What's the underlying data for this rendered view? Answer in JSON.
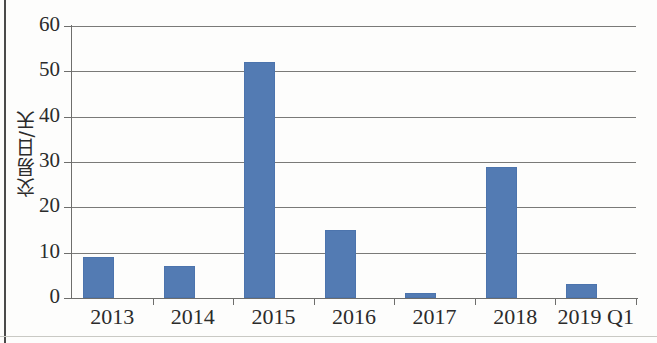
{
  "chart_data": {
    "type": "bar",
    "title": "",
    "subtitle": "",
    "xlabel": "",
    "ylabel": "交易日/天",
    "categories": [
      "2013",
      "2014",
      "2015",
      "2016",
      "2017",
      "2018",
      "2019 Q1"
    ],
    "values": [
      9,
      7,
      52,
      15,
      1,
      29,
      3
    ],
    "series": [
      {
        "name": "交易日/天",
        "values": [
          9,
          7,
          52,
          15,
          1,
          29,
          3
        ]
      }
    ],
    "ylim": [
      0,
      60
    ],
    "yticks": [
      0,
      10,
      20,
      30,
      40,
      50,
      60
    ],
    "ytick_labels": [
      "0",
      "10",
      "20",
      "30",
      "40",
      "50",
      "60"
    ],
    "grid": "horizontal",
    "legend": "none",
    "bar_color": "#537bb3",
    "gridline_color": "#7a7a78",
    "axis_color": "#6e6e6c",
    "text_color": "#2b2b2b",
    "background_color": "#fdfdfc"
  }
}
